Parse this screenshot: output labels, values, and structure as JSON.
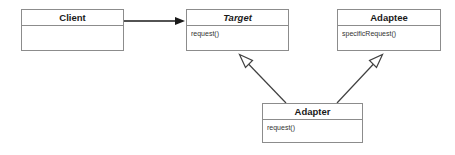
{
  "diagram": {
    "background_color": "#ffffff",
    "line_color": "#8c8c8c",
    "edge_color": "#333333",
    "text_color": "#1a1a1a",
    "classes": [
      {
        "id": "client",
        "name": "Client",
        "abstract": false,
        "members": [],
        "x": 21,
        "y": 9,
        "width": 103,
        "height": 42
      },
      {
        "id": "target",
        "name": "Target",
        "abstract": true,
        "members": [
          "request()"
        ],
        "x": 186,
        "y": 9,
        "width": 103,
        "height": 42
      },
      {
        "id": "adaptee",
        "name": "Adaptee",
        "abstract": false,
        "members": [
          "specificRequest()"
        ],
        "x": 337,
        "y": 9,
        "width": 104,
        "height": 42
      },
      {
        "id": "adapter",
        "name": "Adapter",
        "abstract": false,
        "members": [
          "request()"
        ],
        "x": 262,
        "y": 103,
        "width": 101,
        "height": 40
      }
    ],
    "edges": [
      {
        "id": "client-to-target",
        "type": "association",
        "from": "client",
        "to": "target",
        "arrowhead": "filled-arrow",
        "x1": 124,
        "y1": 21,
        "x2": 185,
        "y2": 21
      },
      {
        "id": "adapter-to-target",
        "type": "generalization",
        "from": "adapter",
        "to": "target",
        "arrowhead": "hollow-triangle",
        "x1": 286,
        "y1": 103,
        "x2": 240,
        "y2": 55
      },
      {
        "id": "adapter-to-adaptee",
        "type": "generalization",
        "from": "adapter",
        "to": "adaptee",
        "arrowhead": "hollow-triangle",
        "x1": 337,
        "y1": 103,
        "x2": 382,
        "y2": 55
      }
    ]
  }
}
